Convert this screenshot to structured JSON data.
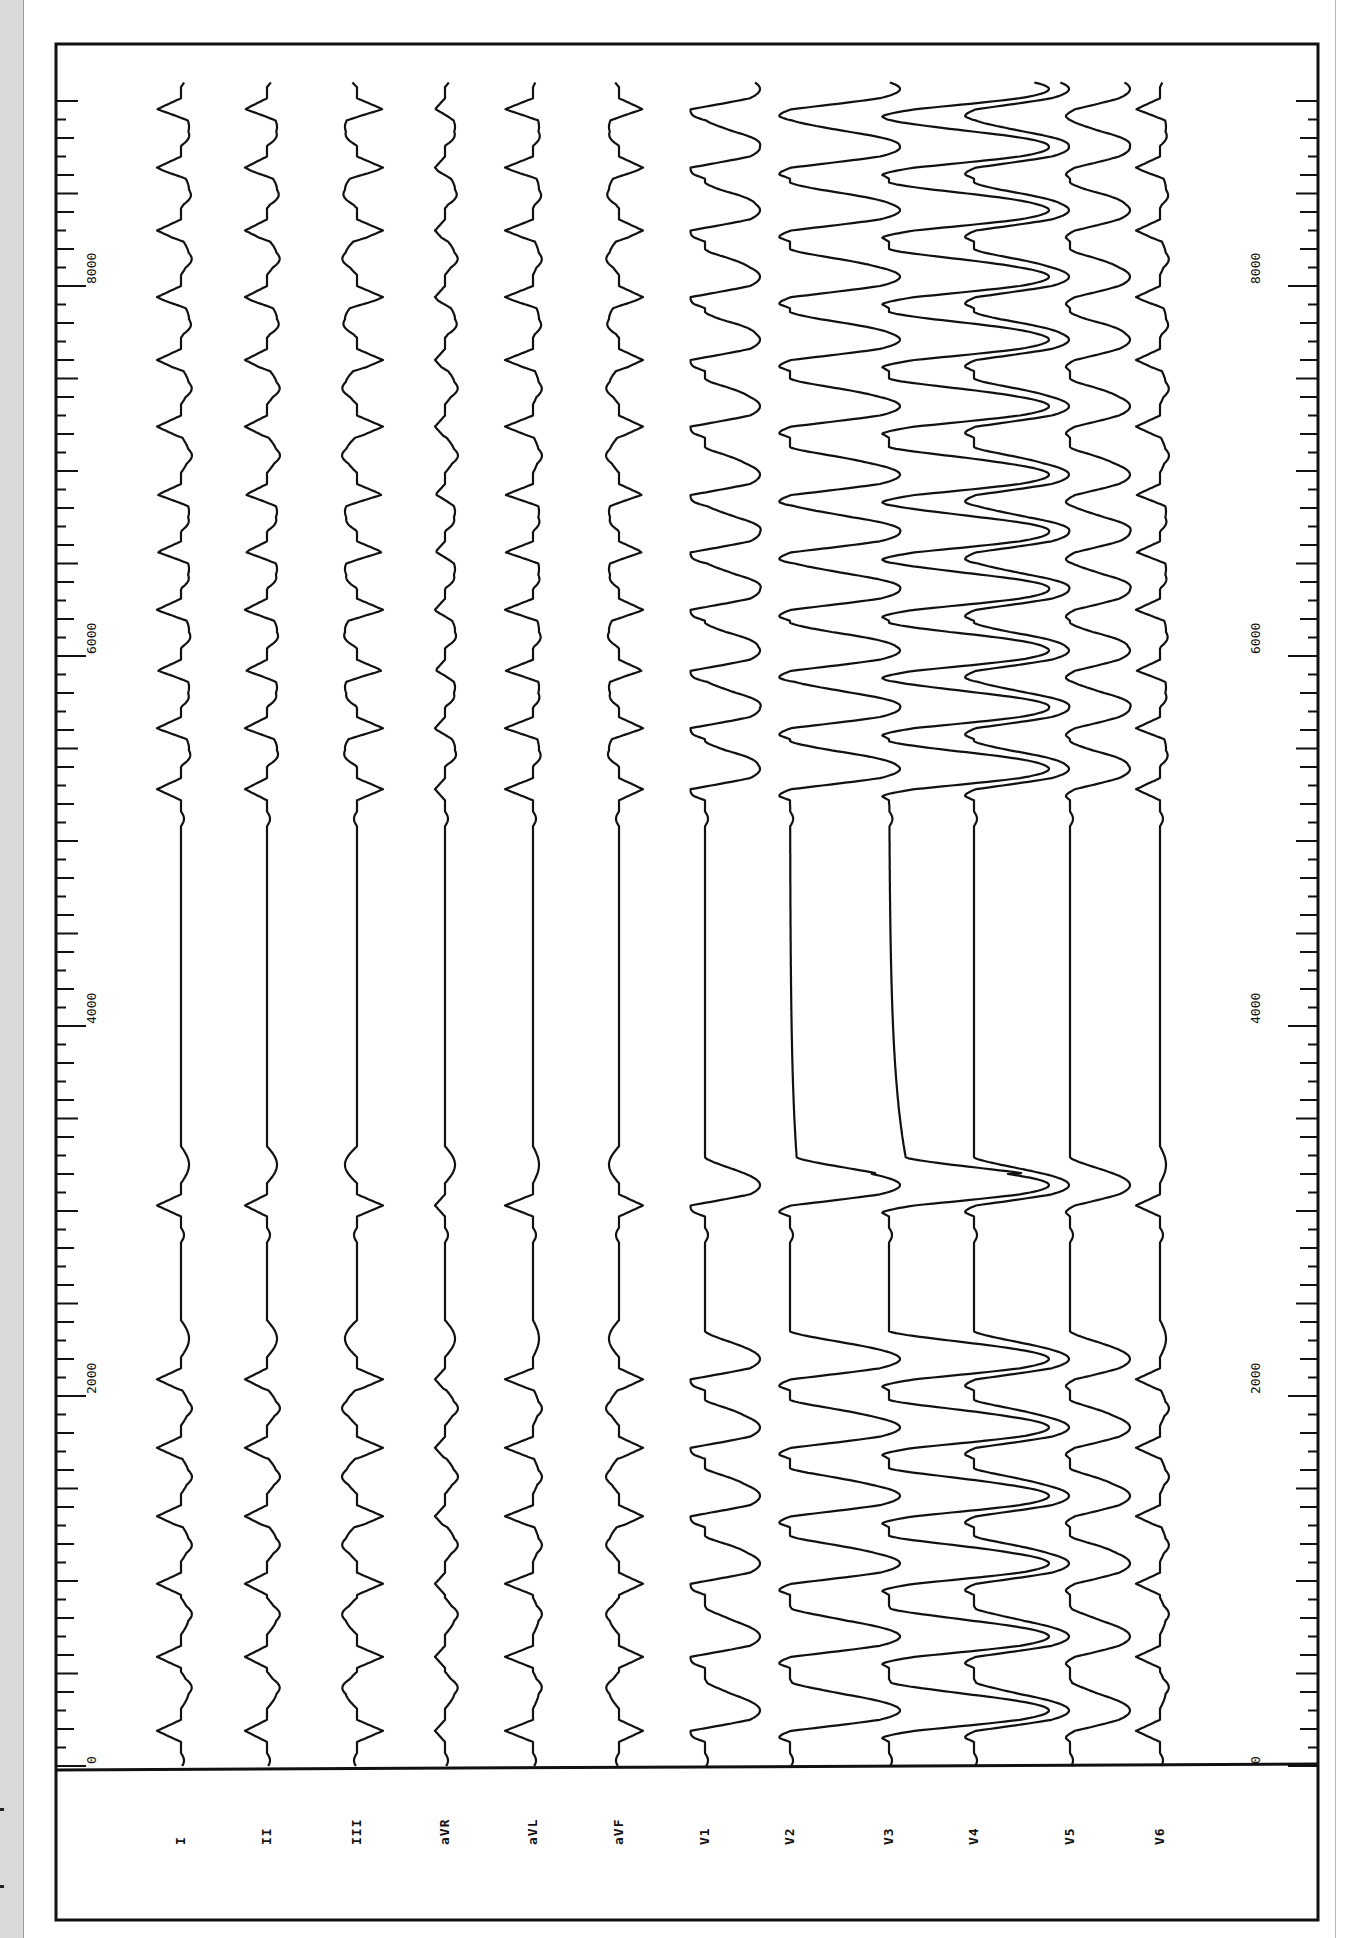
{
  "chart_data": {
    "type": "line",
    "title": "",
    "subtitle": "",
    "xlabel": "",
    "ylabel": "",
    "orientation": "rotated-90 (time axis runs bottom to top)",
    "grid": false,
    "legend": "none",
    "time_axis": {
      "range_ms": [
        0,
        9000
      ],
      "major_ticks": [
        0,
        2000,
        4000,
        6000,
        8000
      ],
      "tick_labels": [
        "0",
        "2000",
        "4000",
        "6000",
        "8000"
      ],
      "minor_tick_ms": 100
    },
    "leads": [
      "I",
      "II",
      "III",
      "aVR",
      "aVL",
      "aVF",
      "V1",
      "V2",
      "V3",
      "V4",
      "V5",
      "V6"
    ],
    "beat_times_ms": [
      190,
      590,
      985,
      1350,
      1720,
      2090,
      3030,
      5280,
      5610,
      5920,
      6250,
      6560,
      6870,
      7240,
      7600,
      7940,
      8300,
      8640,
      8955
    ],
    "annotations": [
      "Long pause between ~3030 ms and ~5280 ms"
    ]
  },
  "labels": {
    "leads": [
      "I",
      "II",
      "III",
      "aVR",
      "aVL",
      "aVF",
      "V1",
      "V2",
      "V3",
      "V4",
      "V5",
      "V6"
    ],
    "axis_left": [
      "0",
      "2000",
      "4000",
      "6000",
      "8000"
    ],
    "axis_right": [
      "0",
      "2000",
      "4000",
      "6000",
      "8000"
    ]
  }
}
